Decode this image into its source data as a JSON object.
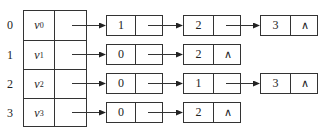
{
  "vertices": [
    {
      "index": "0",
      "name": "v",
      "sub": "0",
      "nodes": [
        {
          "data": "1",
          "next": ""
        },
        {
          "data": "2",
          "next": ""
        },
        {
          "data": "3",
          "next": "∧"
        }
      ]
    },
    {
      "index": "1",
      "name": "v",
      "sub": "1",
      "nodes": [
        {
          "data": "0",
          "next": ""
        },
        {
          "data": "2",
          "next": "∧"
        }
      ]
    },
    {
      "index": "2",
      "name": "v",
      "sub": "2",
      "nodes": [
        {
          "data": "0",
          "next": ""
        },
        {
          "data": "1",
          "next": ""
        },
        {
          "data": "3",
          "next": "∧"
        }
      ]
    },
    {
      "index": "3",
      "name": "v",
      "sub": "3",
      "nodes": [
        {
          "data": "0",
          "next": ""
        },
        {
          "data": "2",
          "next": "∧"
        }
      ]
    }
  ],
  "colors": {
    "line": "#333333",
    "background": "#ffffff"
  }
}
